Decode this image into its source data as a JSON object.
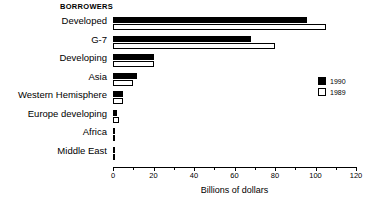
{
  "chart_data": {
    "type": "bar",
    "orientation": "horizontal",
    "title": "BORROWERS",
    "xlabel": "Billions of dollars",
    "ylabel": "",
    "xlim": [
      0,
      120
    ],
    "grid": false,
    "legend_position": "right",
    "xticks": [
      0,
      20,
      40,
      60,
      80,
      100,
      120
    ],
    "xtick_labels": [
      "0",
      "20",
      "40",
      "60",
      "80",
      "100",
      "120"
    ],
    "minor_xticks": [
      10,
      30,
      50,
      70,
      90,
      110
    ],
    "categories": [
      "Developed",
      "G-7",
      "Developing",
      "Asia",
      "Western Hemisphere",
      "Europe developing",
      "Africa",
      "Middle East"
    ],
    "series": [
      {
        "name": "1990",
        "color": "#000000",
        "values": [
          96,
          68,
          20,
          12,
          5,
          2,
          1,
          0.5
        ]
      },
      {
        "name": "1989",
        "color": "#ffffff",
        "values": [
          105,
          80,
          20,
          10,
          5,
          3,
          0.4,
          0.6
        ]
      }
    ]
  },
  "legend": {
    "items": [
      {
        "label": "1990",
        "style": "filled"
      },
      {
        "label": "1989",
        "style": "hollow"
      }
    ]
  }
}
